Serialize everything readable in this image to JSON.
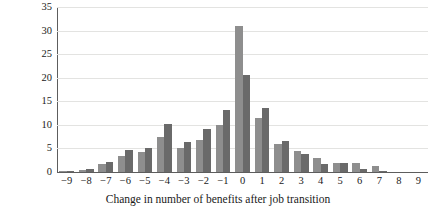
{
  "chart_data": {
    "type": "bar",
    "title": "",
    "subtitle": "",
    "xlabel": "Change in number of benefits after job transition",
    "ylabel": "",
    "xlim": [
      -9,
      9
    ],
    "ylim": [
      0,
      35
    ],
    "grid": true,
    "legend_position": "none",
    "y_ticks": [
      35,
      30,
      25,
      20,
      15,
      10,
      5,
      0
    ],
    "categories": [
      "−9",
      "−8",
      "−7",
      "−6",
      "−5",
      "−4",
      "−3",
      "−2",
      "−1",
      "0",
      "1",
      "2",
      "3",
      "4",
      "5",
      "6",
      "7",
      "8",
      "9"
    ],
    "series": [
      {
        "name": "series-1",
        "color": "#8e8e8e",
        "values": [
          0.2,
          0.5,
          1.6,
          3.5,
          4.2,
          7.5,
          5.0,
          6.8,
          10.0,
          31.0,
          11.5,
          6.0,
          4.5,
          3.0,
          2.0,
          2.0,
          1.3,
          0,
          0
        ]
      },
      {
        "name": "series-2",
        "color": "#6a6a6a",
        "values": [
          0.2,
          0.7,
          2.1,
          4.6,
          5.2,
          10.1,
          6.4,
          9.2,
          13.2,
          20.5,
          13.5,
          6.5,
          3.8,
          1.8,
          2.0,
          0.6,
          0.2,
          0,
          0
        ]
      }
    ]
  }
}
